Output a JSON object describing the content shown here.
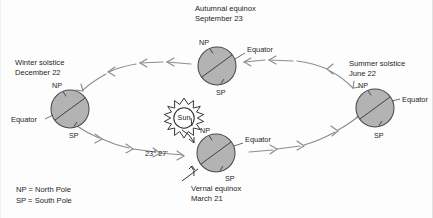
{
  "diagram": {
    "title_semantic": "earth-orbit-seasons-diagram",
    "center": {
      "label": "Sun",
      "icon": "sun-icon"
    },
    "axis_tilt": {
      "label": "23° 27'",
      "icon": "tilt-angle-annotation"
    },
    "positions": [
      {
        "id": "winter-solstice",
        "name": "Winter solstice",
        "date": "December 22",
        "np": "NP",
        "sp": "SP",
        "equator": "Equator"
      },
      {
        "id": "autumnal-equinox",
        "name": "Autumnal equinox",
        "date": "September 23",
        "np": "NP",
        "sp": "SP",
        "equator": "Equator"
      },
      {
        "id": "summer-solstice",
        "name": "Summer solstice",
        "date": "June 22",
        "np": "NP",
        "sp": "SP",
        "equator": "Equator"
      },
      {
        "id": "vernal-equinox",
        "name": "Vernal equinox",
        "date": "March 21",
        "np": "NP",
        "sp": "SP",
        "equator": "Equator"
      }
    ],
    "legend": [
      {
        "abbr_line": "NP  =  North Pole"
      },
      {
        "abbr_line": "SP  =  South Pole"
      }
    ],
    "colors": {
      "earth_fill": "#b3b3b3",
      "earth_stroke": "#4a4a4a",
      "orbit_stroke": "#8d8d8d",
      "text": "#1d1d1d",
      "background": "#fdfdfd"
    }
  }
}
